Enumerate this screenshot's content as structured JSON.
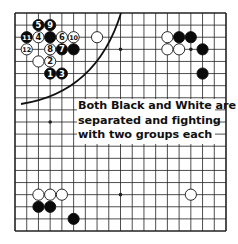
{
  "diagram": {
    "type": "go-board",
    "size": 19,
    "colors": {
      "line": "#222222",
      "black_stone": "#0a0a0a",
      "white_stone": "#ffffff",
      "curve": "#111111",
      "background": "#ffffff"
    },
    "star_points": [
      [
        3,
        3
      ],
      [
        9,
        3
      ],
      [
        15,
        3
      ],
      [
        3,
        9
      ],
      [
        9,
        9
      ],
      [
        15,
        9
      ],
      [
        3,
        15
      ],
      [
        9,
        15
      ],
      [
        15,
        15
      ]
    ],
    "stones": [
      {
        "color": "black",
        "col": 2,
        "row": 1,
        "label": "5"
      },
      {
        "color": "black",
        "col": 3,
        "row": 1,
        "label": "9"
      },
      {
        "color": "black",
        "col": 1,
        "row": 2,
        "label": "11"
      },
      {
        "color": "white",
        "col": 2,
        "row": 2,
        "label": "4"
      },
      {
        "color": "black",
        "col": 3,
        "row": 2,
        "label": ""
      },
      {
        "color": "white",
        "col": 4,
        "row": 2,
        "label": "6"
      },
      {
        "color": "white",
        "col": 5,
        "row": 2,
        "label": "10"
      },
      {
        "color": "white",
        "col": 1,
        "row": 3,
        "label": "12"
      },
      {
        "color": "white",
        "col": 3,
        "row": 3,
        "label": "8"
      },
      {
        "color": "black",
        "col": 4,
        "row": 3,
        "label": "7"
      },
      {
        "color": "black",
        "col": 5,
        "row": 3,
        "label": ""
      },
      {
        "color": "white",
        "col": 2,
        "row": 4,
        "label": ""
      },
      {
        "color": "white",
        "col": 3,
        "row": 4,
        "label": "2"
      },
      {
        "color": "black",
        "col": 3,
        "row": 5,
        "label": "1"
      },
      {
        "color": "black",
        "col": 4,
        "row": 5,
        "label": "3"
      },
      {
        "color": "white",
        "col": 7,
        "row": 2,
        "label": ""
      },
      {
        "color": "white",
        "col": 13,
        "row": 2,
        "label": ""
      },
      {
        "color": "black",
        "col": 14,
        "row": 2,
        "label": ""
      },
      {
        "color": "black",
        "col": 15,
        "row": 2,
        "label": ""
      },
      {
        "color": "white",
        "col": 13,
        "row": 3,
        "label": ""
      },
      {
        "color": "white",
        "col": 14,
        "row": 3,
        "label": ""
      },
      {
        "color": "black",
        "col": 16,
        "row": 3,
        "label": ""
      },
      {
        "color": "black",
        "col": 16,
        "row": 5,
        "label": ""
      },
      {
        "color": "white",
        "col": 2,
        "row": 15,
        "label": ""
      },
      {
        "color": "white",
        "col": 3,
        "row": 15,
        "label": ""
      },
      {
        "color": "white",
        "col": 4,
        "row": 15,
        "label": ""
      },
      {
        "color": "black",
        "col": 2,
        "row": 16,
        "label": ""
      },
      {
        "color": "black",
        "col": 3,
        "row": 16,
        "label": ""
      },
      {
        "color": "black",
        "col": 5,
        "row": 17,
        "label": ""
      },
      {
        "color": "white",
        "col": 15,
        "row": 15,
        "label": ""
      }
    ],
    "dividing_curve": "arc from top edge near column 9 sweeping down-left to the left edge around row 7-8",
    "caption": {
      "line1": "Both Black and White are",
      "line2": "separated and fighting",
      "line3": "with two groups each"
    }
  }
}
